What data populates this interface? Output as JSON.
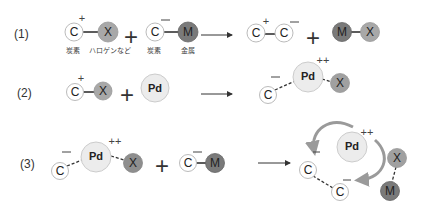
{
  "rows": [
    {
      "label": "(1)",
      "reactants": {
        "c1": "C",
        "c1_charge": "+",
        "x1": "X",
        "c2": "C",
        "c2_charge": "−",
        "m1": "M",
        "plus": "+"
      },
      "captions": [
        "炭素",
        "ハロゲンなど",
        "炭素",
        "金属"
      ],
      "products": {
        "c3": "C",
        "c3_charge": "+",
        "c4": "C",
        "c4_charge": "−",
        "plus": "+",
        "m2": "M",
        "x2": "X"
      }
    },
    {
      "label": "(2)",
      "reactants": {
        "c1": "C",
        "c1_charge": "+",
        "x1": "X",
        "plus": "+",
        "pd": "Pd"
      },
      "products": {
        "c2": "C",
        "c2_charge": "−",
        "pd": "Pd",
        "pd_charge": "++",
        "x2": "X"
      }
    },
    {
      "label": "(3)",
      "reactants": {
        "c1": "C",
        "c1_charge": "−",
        "pd": "Pd",
        "pd_charge": "++",
        "x1": "X",
        "plus": "+",
        "c2": "C",
        "c2_charge": "−",
        "m1": "M"
      },
      "products": {
        "c3": "C",
        "c3_charge": "−",
        "c4": "C",
        "c4_charge": "−",
        "pd": "Pd",
        "pd_charge": "++",
        "x2": "X",
        "m2": "M"
      }
    }
  ],
  "colors": {
    "carbon_fill": "#ffffff",
    "halogen_fill": "#a8a8a8",
    "metal_fill": "#7a7a7a",
    "pd_fill": "#ececec",
    "curved_arrow": "#9a9a9a",
    "line": "#333333"
  }
}
